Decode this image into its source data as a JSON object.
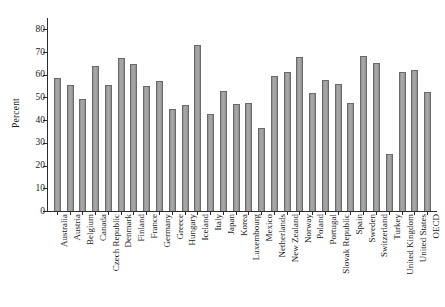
{
  "chart_data": {
    "type": "bar",
    "title": "",
    "subtitle": "",
    "xlabel": "",
    "ylabel": "Percent",
    "ylim": [
      0,
      85
    ],
    "yticks": [
      0,
      10,
      20,
      30,
      40,
      50,
      60,
      70,
      80
    ],
    "grid": false,
    "legend": null,
    "bar_color": "#9d9d9d",
    "bar_edge_color": "#6a6a6a",
    "axis_color": "#2b2b2b",
    "categories": [
      "Australia",
      "Austria",
      "Belgium",
      "Canada",
      "Czech Republic",
      "Denmark",
      "Finland",
      "France",
      "Germany",
      "Greece",
      "Hungary",
      "Iceland",
      "Italy",
      "Japan",
      "Korea",
      "Luxembourg",
      "Mexico",
      "Netherlands",
      "New Zealand",
      "Norway",
      "Poland",
      "Portugal",
      "Slovak Republic",
      "Spain",
      "Sweden",
      "Switzerland",
      "Turkey",
      "United Kingdom",
      "United States",
      "OECD"
    ],
    "values": [
      58.8,
      55.3,
      49.2,
      64.0,
      55.7,
      67.6,
      64.6,
      55.2,
      57.2,
      45.0,
      46.7,
      73.0,
      42.7,
      52.9,
      47.2,
      47.4,
      36.5,
      59.3,
      61.2,
      68.0,
      51.9,
      57.5,
      55.8,
      47.5,
      68.2,
      65.4,
      25.0,
      61.4,
      62.1,
      52.5
    ]
  }
}
